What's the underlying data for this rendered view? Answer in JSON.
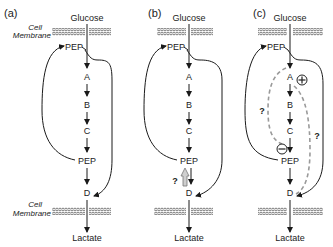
{
  "figure": {
    "panels": [
      {
        "id": "a",
        "label": "(a)",
        "top_input": "Glucose",
        "bottom_output": "Lactate",
        "membrane_label_line1": "Cell",
        "membrane_label_line2": "Membrane",
        "feedback_metabolite": "PEP",
        "pathway": [
          "A",
          "B",
          "C",
          "PEP",
          "D"
        ]
      },
      {
        "id": "b",
        "label": "(b)",
        "top_input": "Glucose",
        "bottom_output": "Lactate",
        "feedback_metabolite": "PEP",
        "pathway": [
          "A",
          "B",
          "C",
          "PEP",
          "D"
        ],
        "reverse_flux_mark": "?"
      },
      {
        "id": "c",
        "label": "(c)",
        "top_input": "Glucose",
        "bottom_output": "Lactate",
        "feedback_metabolite": "PEP",
        "pathway": [
          "A",
          "B",
          "C",
          "PEP",
          "D"
        ],
        "activation_symbol": "+",
        "inhibition_symbol": "−",
        "left_question": "?",
        "right_question": "?"
      }
    ],
    "colors": {
      "line": "#1a1a1a",
      "dashed": "#9a9a9a",
      "membrane": "#555555",
      "text": "#222222"
    }
  }
}
